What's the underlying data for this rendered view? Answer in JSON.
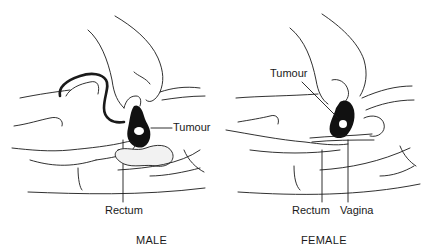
{
  "panels": [
    {
      "caption": "MALE",
      "labels": {
        "tumour": "Tumour",
        "rectum": "Rectum"
      }
    },
    {
      "caption": "FEMALE",
      "labels": {
        "tumour": "Tumour",
        "rectum": "Rectum",
        "vagina": "Vagina"
      }
    }
  ],
  "colors": {
    "line": "#1a1a1a",
    "tumour_fill": "#111111",
    "background": "#ffffff"
  }
}
